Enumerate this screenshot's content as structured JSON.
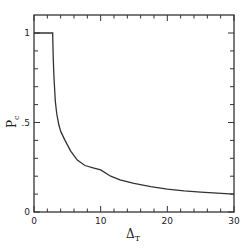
{
  "chart_data": {
    "type": "line",
    "title": "",
    "xlabel": "Δ",
    "xlabel_sub": "T",
    "ylabel": "P",
    "ylabel_sub": "c",
    "xlim": [
      0,
      30
    ],
    "ylim": [
      0,
      1
    ],
    "grid": false,
    "legend": null,
    "x_ticks": [
      {
        "value": 0,
        "label": "0"
      },
      {
        "value": 10,
        "label": "10"
      },
      {
        "value": 20,
        "label": "20"
      },
      {
        "value": 30,
        "label": "30"
      }
    ],
    "x_minor_step": 2,
    "y_ticks": [
      {
        "value": 0,
        "label": "0"
      },
      {
        "value": 0.5,
        "label": ".5"
      },
      {
        "value": 1,
        "label": "1"
      }
    ],
    "y_minor_step": 0.1,
    "series": [
      {
        "name": "P_c",
        "x": [
          0,
          2.8,
          2.8,
          2.9,
          3.0,
          3.2,
          3.4,
          3.7,
          4.0,
          4.65,
          5.5,
          6.5,
          7.65,
          9.0,
          10,
          11.5,
          12.9,
          15,
          17.5,
          20,
          22.5,
          25,
          27.5,
          30
        ],
        "y": [
          1.0,
          1.0,
          0.98,
          0.85,
          0.75,
          0.62,
          0.55,
          0.49,
          0.45,
          0.4,
          0.34,
          0.29,
          0.26,
          0.245,
          0.235,
          0.2,
          0.18,
          0.16,
          0.142,
          0.128,
          0.118,
          0.111,
          0.105,
          0.1
        ]
      }
    ]
  },
  "plot": {
    "left": 34,
    "top": 15,
    "right": 234,
    "bottom": 212,
    "y1_pixel": 33
  }
}
